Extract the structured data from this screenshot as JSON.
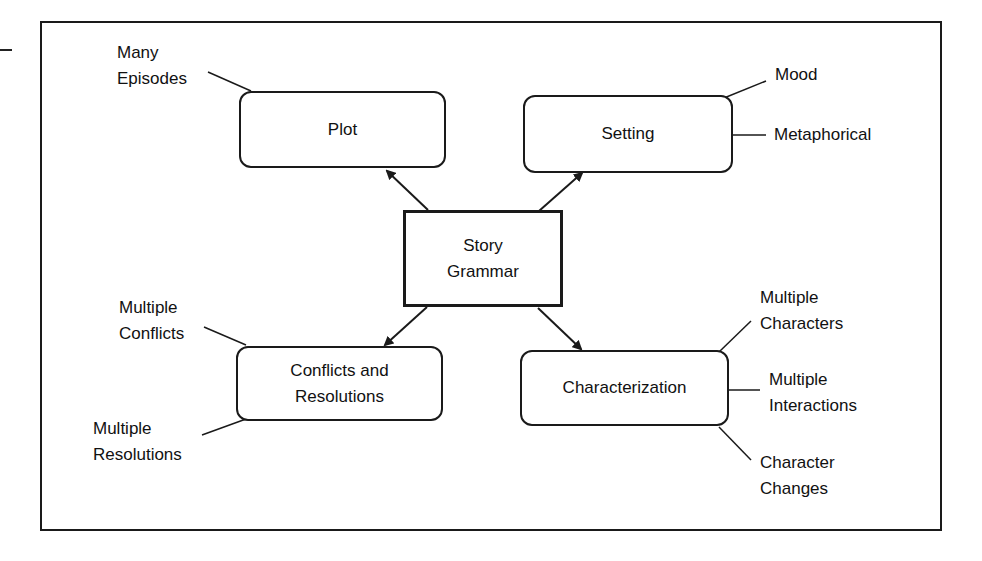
{
  "diagram": {
    "center": {
      "label": "Story\nGrammar"
    },
    "nodes": [
      {
        "id": "plot",
        "label": "Plot",
        "attributes": [
          "Many\nEpisodes"
        ]
      },
      {
        "id": "setting",
        "label": "Setting",
        "attributes": [
          "Mood",
          "Metaphorical"
        ]
      },
      {
        "id": "conflicts",
        "label": "Conflicts and\nResolutions",
        "attributes": [
          "Multiple\nConflicts",
          "Multiple\nResolutions"
        ]
      },
      {
        "id": "characterization",
        "label": "Characterization",
        "attributes": [
          "Multiple\nCharacters",
          "Multiple\nInteractions",
          "Character\nChanges"
        ]
      }
    ],
    "colors": {
      "stroke": "#1a1a1a",
      "background": "#ffffff"
    }
  }
}
